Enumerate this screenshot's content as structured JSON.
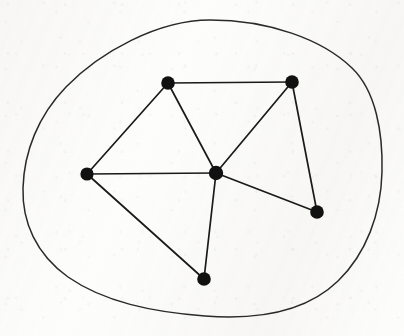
{
  "figure": {
    "kind": "planar-graph-diagram",
    "width": 404,
    "height": 336,
    "background_color": "#fdfdfc",
    "ink_color": "#1a1a1a",
    "vertex_color": "#111111",
    "edge_color": "#1a1a1a",
    "boundary_color": "#2a2a2a",
    "edge_stroke_width": 1.7,
    "boundary_stroke_width": 1.5,
    "vertex_radius": 6.6
  },
  "chart_data": {
    "type": "diagram",
    "title": "",
    "xlabel": "",
    "ylabel": "",
    "coordinate_space": {
      "x_range": [
        0,
        404
      ],
      "y_range": [
        0,
        336
      ],
      "y_axis_direction": "down"
    },
    "nodes": [
      {
        "id": "top_left",
        "label": "",
        "x": 168,
        "y": 83,
        "degree": 3,
        "radius": 6.8
      },
      {
        "id": "top_right",
        "label": "",
        "x": 292,
        "y": 82,
        "degree": 3,
        "radius": 6.8
      },
      {
        "id": "left",
        "label": "",
        "x": 87,
        "y": 174,
        "degree": 3,
        "radius": 6.6
      },
      {
        "id": "center",
        "label": "",
        "x": 216,
        "y": 173,
        "degree": 5,
        "radius": 7.2
      },
      {
        "id": "right",
        "label": "",
        "x": 317,
        "y": 212,
        "degree": 3,
        "radius": 6.8
      },
      {
        "id": "bottom",
        "label": "",
        "x": 204,
        "y": 279,
        "degree": 3,
        "radius": 6.8
      }
    ],
    "edges": [
      {
        "id": "e1",
        "source": "top_left",
        "target": "top_right"
      },
      {
        "id": "e2",
        "source": "top_left",
        "target": "left"
      },
      {
        "id": "e3",
        "source": "top_left",
        "target": "center"
      },
      {
        "id": "e4",
        "source": "top_right",
        "target": "center"
      },
      {
        "id": "e5",
        "source": "top_right",
        "target": "right"
      },
      {
        "id": "e6",
        "source": "left",
        "target": "center"
      },
      {
        "id": "e7",
        "source": "left",
        "target": "bottom"
      },
      {
        "id": "e8",
        "source": "center",
        "target": "right"
      },
      {
        "id": "e9",
        "source": "center",
        "target": "bottom"
      }
    ],
    "boundary_curve": {
      "id": "enclosing_curve",
      "closed": true,
      "filled": false,
      "extremes": {
        "top_y": 20,
        "bottom_y": 316,
        "left_x": 22,
        "right_x": 382
      },
      "path": "M 210 20 C 268 20 322 39 352 68 C 376 91 383 133 382 172 C 381 214 366 254 338 281 C 306 312 257 320 205 316 C 152 312 104 302 68 277 C 36 254 22 222 23 188 C 24 152 38 116 66 87 C 100 52 158 20 210 20 Z"
    },
    "counts": {
      "vertices": 6,
      "edges": 9,
      "faces_inside_curve": 5
    }
  }
}
